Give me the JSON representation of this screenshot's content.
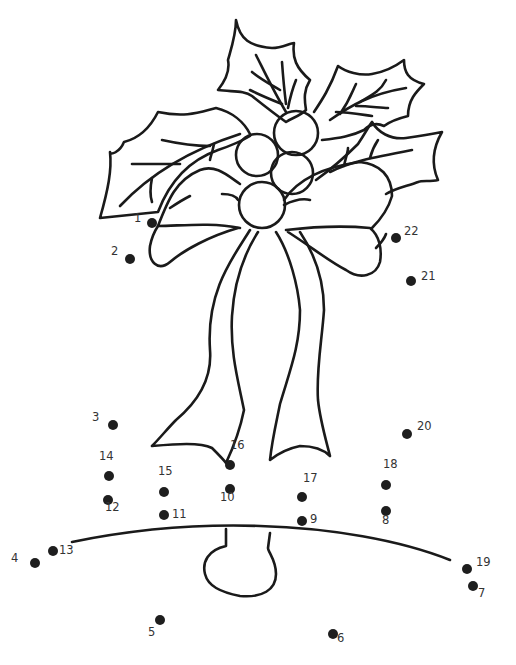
{
  "worksheet": {
    "subject": "Christmas bell with holly and bow",
    "colors": {
      "line": "#1a1a1a",
      "dot": "#1e1e1e",
      "label": "#333333",
      "background": "#ffffff"
    },
    "dots": [
      {
        "n": "1",
        "x": 152,
        "y": 223,
        "lx": 134,
        "ly": 219
      },
      {
        "n": "2",
        "x": 130,
        "y": 259,
        "lx": 111,
        "ly": 252
      },
      {
        "n": "3",
        "x": 113,
        "y": 425,
        "lx": 92,
        "ly": 418
      },
      {
        "n": "4",
        "x": 35,
        "y": 563,
        "lx": 11,
        "ly": 559
      },
      {
        "n": "5",
        "x": 160,
        "y": 620,
        "lx": 148,
        "ly": 633
      },
      {
        "n": "6",
        "x": 333,
        "y": 634,
        "lx": 337,
        "ly": 639
      },
      {
        "n": "7",
        "x": 473,
        "y": 586,
        "lx": 478,
        "ly": 594
      },
      {
        "n": "8",
        "x": 386,
        "y": 511,
        "lx": 382,
        "ly": 521
      },
      {
        "n": "9",
        "x": 302,
        "y": 521,
        "lx": 310,
        "ly": 520
      },
      {
        "n": "10",
        "x": 230,
        "y": 489,
        "lx": 220,
        "ly": 498
      },
      {
        "n": "11",
        "x": 164,
        "y": 515,
        "lx": 172,
        "ly": 515
      },
      {
        "n": "12",
        "x": 108,
        "y": 500,
        "lx": 105,
        "ly": 508
      },
      {
        "n": "13",
        "x": 53,
        "y": 551,
        "lx": 59,
        "ly": 551
      },
      {
        "n": "14",
        "x": 109,
        "y": 476,
        "lx": 99,
        "ly": 457
      },
      {
        "n": "15",
        "x": 164,
        "y": 492,
        "lx": 158,
        "ly": 472
      },
      {
        "n": "16",
        "x": 230,
        "y": 465,
        "lx": 230,
        "ly": 446
      },
      {
        "n": "17",
        "x": 302,
        "y": 497,
        "lx": 303,
        "ly": 479
      },
      {
        "n": "18",
        "x": 386,
        "y": 485,
        "lx": 383,
        "ly": 465
      },
      {
        "n": "19",
        "x": 467,
        "y": 569,
        "lx": 476,
        "ly": 563
      },
      {
        "n": "20",
        "x": 407,
        "y": 434,
        "lx": 417,
        "ly": 427
      },
      {
        "n": "21",
        "x": 411,
        "y": 281,
        "lx": 421,
        "ly": 277
      },
      {
        "n": "22",
        "x": 396,
        "y": 238,
        "lx": 404,
        "ly": 232
      }
    ]
  }
}
